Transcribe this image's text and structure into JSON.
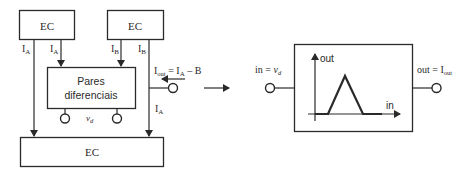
{
  "left_diagram": {
    "top_left_block": {
      "label": "EC"
    },
    "top_right_block": {
      "label": "EC"
    },
    "bottom_block": {
      "label": "EC"
    },
    "diff_pair_block": {
      "line1": "Pares",
      "line2": "diferenciais"
    },
    "currents": {
      "left_outer": {
        "main": "I",
        "sub": "A"
      },
      "left_inner": {
        "main": "I",
        "sub": "A"
      },
      "right_inner": {
        "main": "I",
        "sub": "B"
      },
      "right_outer": {
        "main": "I",
        "sub": "B"
      },
      "right_lower": {
        "main": "I",
        "sub": "A"
      }
    },
    "output_equation": {
      "main": "I",
      "sub": "out",
      "rest": " = I",
      "sub2": "A",
      "tail": " – B"
    },
    "input_label": {
      "main": "v",
      "sub": "d"
    }
  },
  "transform_arrow": {
    "icon": "right-arrow"
  },
  "right_diagram": {
    "input_label": {
      "prefix": "in = ",
      "var": "v",
      "sub": "d"
    },
    "output_label": {
      "prefix": "out = I",
      "sub": "out"
    },
    "graph": {
      "y_axis_label": "out",
      "x_axis_label": "in",
      "shape": "triangle"
    }
  },
  "colors": {
    "stroke": "#2a2a2a",
    "background": "#ffffff"
  }
}
